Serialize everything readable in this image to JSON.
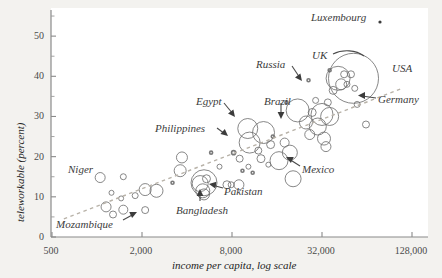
{
  "chart_data": {
    "type": "scatter",
    "title": "",
    "subtitle": "",
    "xlabel": "income per capita, log scale",
    "ylabel": "teleworkable (percent)",
    "xscale": "log",
    "yscale": "linear",
    "xlim": [
      500,
      128000
    ],
    "ylim": [
      0,
      57
    ],
    "xticks": [
      500,
      2000,
      8000,
      32000,
      128000
    ],
    "xticklabels": [
      "500",
      "2,000",
      "8,000",
      "32,000",
      "128,000"
    ],
    "yticks": [
      0,
      10,
      20,
      30,
      40,
      50
    ],
    "yticklabels": [
      "0",
      "10",
      "20",
      "30",
      "40",
      "50"
    ],
    "yminorticks": [
      5,
      15,
      25,
      35,
      45,
      55
    ],
    "grid": false,
    "legend": null,
    "marker": "open-circle",
    "size_encoding": "population",
    "trendline": {
      "style": "dashed",
      "color": "#b8b2a8",
      "x0": 600,
      "y0": 4.5,
      "x1": 110000,
      "y1": 37.0
    },
    "annotations": [
      {
        "label": "Luxembourg",
        "x": 100000,
        "y": 53.5,
        "pointer": "dot"
      },
      {
        "label": "UK",
        "x": 41000,
        "y": 42.5,
        "pointer": "line"
      },
      {
        "label": "USA",
        "x": 63000,
        "y": 39.0,
        "pointer": "none"
      },
      {
        "label": "Germany",
        "x": 52000,
        "y": 31.0,
        "pointer": "arrow"
      },
      {
        "label": "Russia",
        "x": 26000,
        "y": 36.5,
        "pointer": "arrow"
      },
      {
        "label": "Brazil",
        "x": 14500,
        "y": 30.5,
        "pointer": "arrow"
      },
      {
        "label": "Egypt",
        "x": 11500,
        "y": 30.5,
        "pointer": "arrow"
      },
      {
        "label": "Philippines",
        "x": 8000,
        "y": 25.0,
        "pointer": "arrow"
      },
      {
        "label": "Mexico",
        "x": 19000,
        "y": 16.5,
        "pointer": "arrow"
      },
      {
        "label": "Pakistan",
        "x": 6000,
        "y": 13.0,
        "pointer": "arrow"
      },
      {
        "label": "Bangladesh",
        "x": 5200,
        "y": 5.5,
        "pointer": "arrow"
      },
      {
        "label": "Niger",
        "x": 1150,
        "y": 14.5,
        "pointer": "none"
      },
      {
        "label": "Mozambique",
        "x": 900,
        "y": 2.0,
        "pointer": "arrow"
      }
    ],
    "points": [
      {
        "x": 1280,
        "y": 5.6,
        "r": 3.5
      },
      {
        "x": 1150,
        "y": 7.5,
        "r": 5.0
      },
      {
        "x": 1500,
        "y": 6.8,
        "r": 4.5
      },
      {
        "x": 1450,
        "y": 9.6,
        "r": 2.5
      },
      {
        "x": 1250,
        "y": 11.0,
        "r": 2.5
      },
      {
        "x": 1050,
        "y": 14.8,
        "r": 5.0
      },
      {
        "x": 1500,
        "y": 15.0,
        "r": 3.0
      },
      {
        "x": 1800,
        "y": 10.3,
        "r": 3.0
      },
      {
        "x": 2100,
        "y": 11.8,
        "r": 6.0
      },
      {
        "x": 2500,
        "y": 11.5,
        "r": 6.5
      },
      {
        "x": 2100,
        "y": 6.7,
        "r": 3.5
      },
      {
        "x": 3600,
        "y": 16.5,
        "r": 6.0
      },
      {
        "x": 3700,
        "y": 19.8,
        "r": 5.5
      },
      {
        "x": 5200,
        "y": 13.5,
        "r": 13.0
      },
      {
        "x": 4900,
        "y": 13.3,
        "r": 8.0
      },
      {
        "x": 5100,
        "y": 11.5,
        "r": 7.0
      },
      {
        "x": 5400,
        "y": 14.5,
        "r": 4.0
      },
      {
        "x": 5200,
        "y": 10.6,
        "r": 5.5
      },
      {
        "x": 6600,
        "y": 17.5,
        "r": 2.5
      },
      {
        "x": 7400,
        "y": 13.0,
        "r": 4.0
      },
      {
        "x": 7900,
        "y": 13.0,
        "r": 3.0
      },
      {
        "x": 8900,
        "y": 13.0,
        "r": 5.0
      },
      {
        "x": 9000,
        "y": 19.5,
        "r": 3.5
      },
      {
        "x": 10300,
        "y": 17.5,
        "r": 2.5
      },
      {
        "x": 10500,
        "y": 23.5,
        "r": 10.5
      },
      {
        "x": 10200,
        "y": 27.0,
        "r": 10.0
      },
      {
        "x": 13000,
        "y": 26.0,
        "r": 11.0
      },
      {
        "x": 12000,
        "y": 21.5,
        "r": 3.5
      },
      {
        "x": 12500,
        "y": 19.5,
        "r": 4.0
      },
      {
        "x": 14000,
        "y": 18.0,
        "r": 2.5
      },
      {
        "x": 14500,
        "y": 23.0,
        "r": 4.0
      },
      {
        "x": 16500,
        "y": 19.0,
        "r": 9.0
      },
      {
        "x": 18000,
        "y": 23.5,
        "r": 4.5
      },
      {
        "x": 19500,
        "y": 21.0,
        "r": 7.5
      },
      {
        "x": 20500,
        "y": 14.5,
        "r": 8.0
      },
      {
        "x": 22000,
        "y": 31.5,
        "r": 11.5
      },
      {
        "x": 25000,
        "y": 28.5,
        "r": 6.5
      },
      {
        "x": 26500,
        "y": 25.5,
        "r": 5.0
      },
      {
        "x": 27500,
        "y": 31.0,
        "r": 4.0
      },
      {
        "x": 29000,
        "y": 34.0,
        "r": 3.0
      },
      {
        "x": 30000,
        "y": 27.5,
        "r": 8.5
      },
      {
        "x": 32000,
        "y": 30.5,
        "r": 11.0
      },
      {
        "x": 33000,
        "y": 24.5,
        "r": 6.5
      },
      {
        "x": 35000,
        "y": 33.5,
        "r": 3.5
      },
      {
        "x": 38000,
        "y": 36.5,
        "r": 4.0
      },
      {
        "x": 41000,
        "y": 39.5,
        "r": 12.0
      },
      {
        "x": 43000,
        "y": 38.0,
        "r": 5.5
      },
      {
        "x": 45000,
        "y": 40.5,
        "r": 3.5
      },
      {
        "x": 47000,
        "y": 38.0,
        "r": 3.0
      },
      {
        "x": 50000,
        "y": 40.5,
        "r": 3.5
      },
      {
        "x": 53000,
        "y": 37.0,
        "r": 3.0
      },
      {
        "x": 55000,
        "y": 33.0,
        "r": 3.0
      },
      {
        "x": 52000,
        "y": 39.5,
        "r": 25.0
      },
      {
        "x": 36000,
        "y": 30.0,
        "r": 9.0
      },
      {
        "x": 34000,
        "y": 22.5,
        "r": 5.0
      },
      {
        "x": 63000,
        "y": 28.0,
        "r": 3.5
      },
      {
        "x": 8200,
        "y": 21.0,
        "r": 2.0
      },
      {
        "x": 9400,
        "y": 16.5,
        "r": 1.5
      },
      {
        "x": 11000,
        "y": 16.0,
        "r": 1.5
      },
      {
        "x": 5800,
        "y": 21.0,
        "r": 1.5
      },
      {
        "x": 15000,
        "y": 25.0,
        "r": 1.5
      },
      {
        "x": 3200,
        "y": 13.5,
        "r": 1.5
      },
      {
        "x": 18500,
        "y": 33.5,
        "r": 1.5
      },
      {
        "x": 26000,
        "y": 39.0,
        "r": 1.5
      },
      {
        "x": 36000,
        "y": 41.5,
        "r": 1.5
      }
    ]
  },
  "axis": {
    "x_title": "income per capita, log scale",
    "y_title": "teleworkable (percent)"
  }
}
